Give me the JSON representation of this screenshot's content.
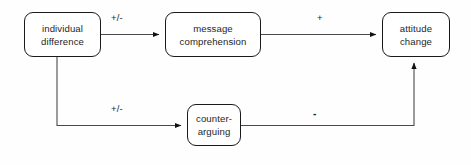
{
  "diagram": {
    "colors": {
      "background": "#fefefe",
      "stroke": "#1a1a1a",
      "text": "#262626"
    },
    "nodes": [
      {
        "id": "individual-difference",
        "lines": [
          "individual",
          "difference"
        ],
        "x": 24,
        "y": 12,
        "w": 77,
        "h": 45
      },
      {
        "id": "message-comprehension",
        "lines": [
          "message",
          "comprehension"
        ],
        "x": 165,
        "y": 12,
        "w": 96,
        "h": 45
      },
      {
        "id": "attitude-change",
        "lines": [
          "attitude",
          "change"
        ],
        "x": 382,
        "y": 12,
        "w": 68,
        "h": 45
      },
      {
        "id": "counter-arguing",
        "lines": [
          "counter-",
          "arguing"
        ],
        "x": 187,
        "y": 104,
        "w": 54,
        "h": 42
      }
    ],
    "edges": [
      {
        "id": "individual-difference-to-message-comprehension",
        "from": "individual-difference",
        "to": "message-comprehension",
        "label": "+/-",
        "label_x": 111,
        "label_y": 13
      },
      {
        "id": "message-comprehension-to-attitude-change",
        "from": "message-comprehension",
        "to": "attitude-change",
        "label": "+",
        "label_x": 317,
        "label_y": 13
      },
      {
        "id": "individual-difference-to-counter-arguing",
        "from": "individual-difference",
        "to": "counter-arguing",
        "label": "+/-",
        "label_x": 111,
        "label_y": 104
      },
      {
        "id": "counter-arguing-to-attitude-change",
        "from": "counter-arguing",
        "to": "attitude-change",
        "label": "-",
        "label_x": 313,
        "label_y": 109
      }
    ]
  }
}
